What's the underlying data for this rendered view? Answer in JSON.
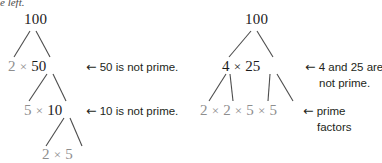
{
  "page": {
    "cutoff_caption": "e left.",
    "width": 382,
    "height": 163,
    "colors": {
      "text": "#231f20",
      "composite": "#1b1b1b",
      "prime": "#8e8e8e",
      "background": "#ffffff"
    }
  },
  "left_tree": {
    "root": "100",
    "level2": {
      "left_factor": "2",
      "operator": "×",
      "right_factor": "50"
    },
    "level3": {
      "left_factor": "5",
      "operator": "×",
      "right_factor": "10"
    },
    "level4": {
      "left_factor": "2",
      "operator": "×",
      "right_factor": "5"
    },
    "annotations": [
      {
        "arrow": "←",
        "text": "50 is not prime."
      },
      {
        "arrow": "←",
        "text": "10 is not prime."
      }
    ]
  },
  "right_tree": {
    "root": "100",
    "level2": {
      "left_factor": "4",
      "operator": "×",
      "right_factor": "25"
    },
    "level3": {
      "factors": [
        "2",
        "2",
        "5",
        "5"
      ],
      "operator": "×"
    },
    "annotations": [
      {
        "arrow": "←",
        "line1": "4 and 25 are",
        "line2": "not prime."
      },
      {
        "arrow": "←",
        "line1": "prime",
        "line2": "factors"
      }
    ]
  }
}
